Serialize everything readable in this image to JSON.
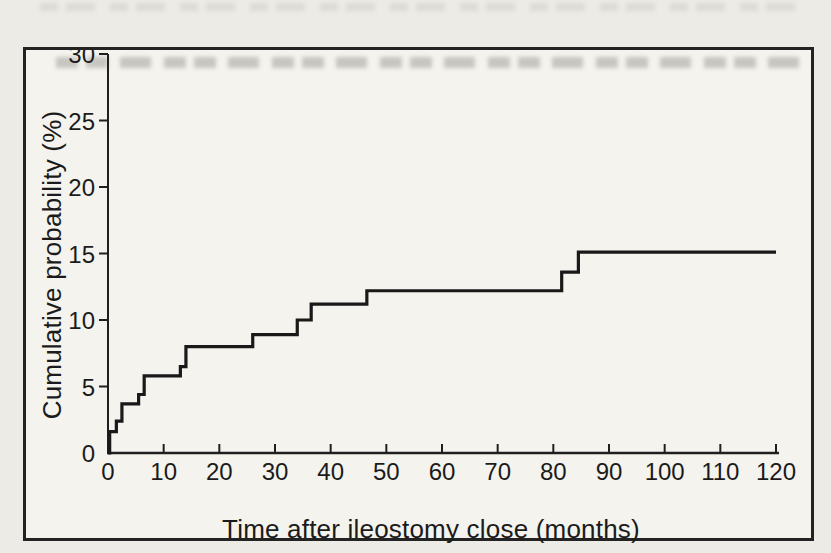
{
  "figure": {
    "page_background": "#ecebe6",
    "frame_background": "#f4f3ee",
    "frame_border_color": "#232323",
    "axis_color": "#1f1f1f",
    "curve_color": "#191919",
    "text_color": "#1b1b1b"
  },
  "chart_data": {
    "type": "line",
    "subtype": "step-cumulative-incidence",
    "title": "",
    "xlabel": "Time after ileostomy close (months)",
    "ylabel": "Cumulative probability (%)",
    "xlim": [
      0,
      120
    ],
    "ylim": [
      0,
      30
    ],
    "x_ticks": [
      0,
      10,
      20,
      30,
      40,
      50,
      60,
      70,
      80,
      90,
      100,
      110,
      120
    ],
    "y_ticks": [
      0,
      5,
      10,
      15,
      20,
      25,
      30
    ],
    "grid": false,
    "legend": null,
    "series": [
      {
        "name": "cumulative-probability",
        "start": [
          0,
          0
        ],
        "steps": [
          [
            0.3,
            1.6
          ],
          [
            1.5,
            2.4
          ],
          [
            2.5,
            3.7
          ],
          [
            5.5,
            4.4
          ],
          [
            6.5,
            5.8
          ],
          [
            13,
            6.5
          ],
          [
            14,
            8.0
          ],
          [
            26,
            8.9
          ],
          [
            34,
            10.0
          ],
          [
            36.5,
            11.2
          ],
          [
            46.5,
            12.2
          ],
          [
            81.5,
            13.6
          ],
          [
            84.5,
            15.1
          ]
        ],
        "end_x": 120,
        "final_value": 15.1
      }
    ]
  }
}
